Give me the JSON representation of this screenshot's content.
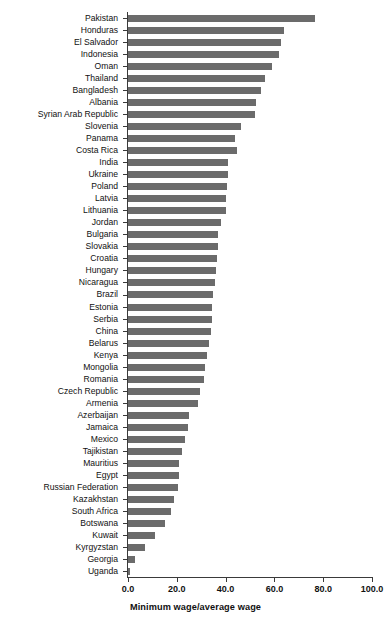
{
  "chart_data": {
    "type": "bar",
    "orientation": "horizontal",
    "title": "",
    "xlabel": "Minimum wage/average wage",
    "ylabel": "",
    "xlim": [
      0,
      100
    ],
    "xticks": [
      "0.0",
      "20.0",
      "40.0",
      "60.0",
      "80.0",
      "100.0"
    ],
    "xtick_values": [
      0,
      20,
      40,
      60,
      80,
      100
    ],
    "grid": false,
    "legend": "none",
    "bar_color": "#6b6b6b",
    "axis_color": "#3a3a3a",
    "categories": [
      "Pakistan",
      "Honduras",
      "El Salvador",
      "Indonesia",
      "Oman",
      "Thailand",
      "Bangladesh",
      "Albania",
      "Syrian Arab Republic",
      "Slovenia",
      "Panama",
      "Costa Rica",
      "India",
      "Ukraine",
      "Poland",
      "Latvia",
      "Lithuania",
      "Jordan",
      "Bulgaria",
      "Slovakia",
      "Croatia",
      "Hungary",
      "Nicaragua",
      "Brazil",
      "Estonia",
      "Serbia",
      "China",
      "Belarus",
      "Kenya",
      "Mongolia",
      "Romania",
      "Czech Republic",
      "Armenia",
      "Azerbaijan",
      "Jamaica",
      "Mexico",
      "Tajikistan",
      "Mauritius",
      "Egypt",
      "Russian Federation",
      "Kazakhstan",
      "South Africa",
      "Botswana",
      "Kuwait",
      "Kyrgyzstan",
      "Georgia",
      "Uganda"
    ],
    "values": [
      76.5,
      64.0,
      62.5,
      62.0,
      59.0,
      56.0,
      54.5,
      52.5,
      52.0,
      46.5,
      44.0,
      44.5,
      41.0,
      41.0,
      40.5,
      40.0,
      40.0,
      38.0,
      37.0,
      37.0,
      36.5,
      36.0,
      35.5,
      35.0,
      34.5,
      34.5,
      34.0,
      33.0,
      32.5,
      31.5,
      31.0,
      29.5,
      28.5,
      25.0,
      24.5,
      23.5,
      22.0,
      21.0,
      21.0,
      20.5,
      19.0,
      17.5,
      15.0,
      11.0,
      7.0,
      3.0,
      1.0
    ]
  }
}
